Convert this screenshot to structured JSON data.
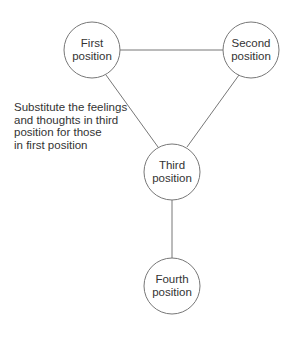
{
  "diagram": {
    "nodes": [
      {
        "id": "first",
        "line1": "First",
        "line2": "position"
      },
      {
        "id": "second",
        "line1": "Second",
        "line2": "position"
      },
      {
        "id": "third",
        "line1": "Third",
        "line2": "position"
      },
      {
        "id": "fourth",
        "line1": "Fourth",
        "line2": "position"
      }
    ],
    "edges": [
      {
        "from": "first",
        "to": "second"
      },
      {
        "from": "first",
        "to": "third"
      },
      {
        "from": "second",
        "to": "third"
      },
      {
        "from": "third",
        "to": "fourth"
      }
    ],
    "annotation": {
      "lines": [
        "Substitute the feelings",
        "and thoughts in third",
        "position for those",
        "in first position"
      ]
    },
    "colors": {
      "stroke": "#777777",
      "text": "#333333",
      "background": "#ffffff"
    }
  }
}
